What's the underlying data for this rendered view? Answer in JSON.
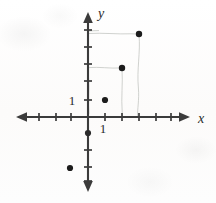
{
  "figure": {
    "background_color": "#fdfdfc",
    "ink_color": "#3b3b3b",
    "point_color": "#1c1c1c",
    "guide_color": "#b9bcb8"
  },
  "axes": {
    "x_label": "x",
    "y_label": "y",
    "x_unit_label": "1",
    "y_unit_label": "1",
    "origin_px": {
      "x": 88,
      "y": 117
    },
    "unit_px": 17,
    "x_axis_px": {
      "x1": 17,
      "x2": 189,
      "y": 117
    },
    "y_axis_px": {
      "y1": 13,
      "y2": 191,
      "x": 88
    },
    "x_ticks_px": [
      22,
      39,
      56,
      71,
      105,
      122,
      139,
      156,
      173
    ],
    "y_ticks_px": [
      30,
      47,
      64,
      81,
      100,
      133,
      150,
      167,
      184
    ],
    "grid": false
  },
  "chart_data": {
    "type": "scatter",
    "title": "",
    "xlabel": "x",
    "ylabel": "y",
    "xlim": [
      -4,
      6
    ],
    "ylim": [
      -4,
      6
    ],
    "unit_tick": 1,
    "grid": false,
    "legend": "none",
    "points": [
      {
        "label": "A",
        "x": 1,
        "y": 1,
        "px": 105,
        "py": 100
      },
      {
        "label": "B",
        "x": 2,
        "y": 3,
        "px": 122,
        "py": 68
      },
      {
        "label": "C",
        "x": 3,
        "y": 5,
        "px": 139,
        "py": 34
      },
      {
        "label": "D",
        "x": -1,
        "y": -3,
        "px": 70,
        "py": 168
      }
    ],
    "guide_segments": [
      {
        "from_px": {
          "x": 89,
          "y": 34
        },
        "to_px": {
          "x": 139,
          "y": 34
        }
      },
      {
        "from_px": {
          "x": 139,
          "y": 34
        },
        "to_px": {
          "x": 139,
          "y": 117
        }
      },
      {
        "from_px": {
          "x": 89,
          "y": 68
        },
        "to_px": {
          "x": 122,
          "y": 68
        }
      },
      {
        "from_px": {
          "x": 122,
          "y": 68
        },
        "to_px": {
          "x": 122,
          "y": 117
        }
      }
    ]
  },
  "labels": {
    "y_unit_pos_px": {
      "x": 72,
      "y": 105
    },
    "x_unit_pos_px": {
      "x": 103,
      "y": 133
    },
    "x_axis_label_pos_px": {
      "x": 198,
      "y": 123
    },
    "y_axis_label_pos_px": {
      "x": 98,
      "y": 18
    }
  }
}
